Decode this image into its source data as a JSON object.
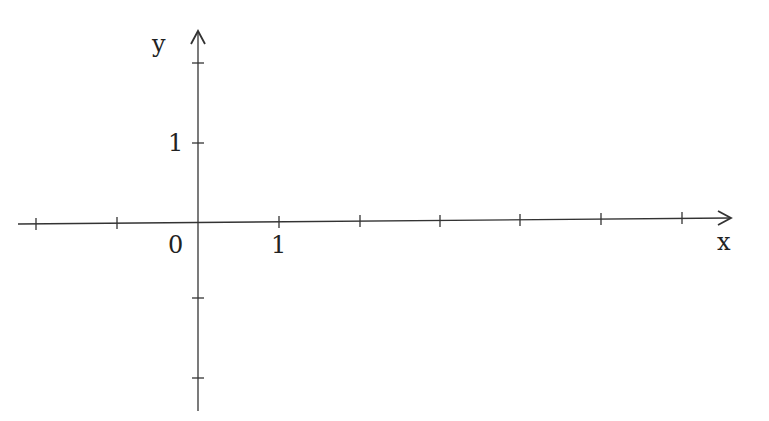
{
  "diagram": {
    "type": "coordinate-axes",
    "x_axis": {
      "label": "x",
      "ticks_px": [
        36,
        117,
        279,
        360,
        440,
        520,
        601,
        682
      ],
      "tick_labels": [
        {
          "text": "0",
          "x": 176,
          "y": 255
        },
        {
          "text": "1",
          "x": 279,
          "y": 255
        }
      ]
    },
    "y_axis": {
      "label": "y",
      "ticks_px": [
        63,
        143,
        298,
        378
      ],
      "tick_labels": [
        {
          "text": "1",
          "x": 176,
          "y": 151
        }
      ]
    },
    "origin_label": "0",
    "x_unit_label": "1",
    "y_unit_label": "1",
    "stroke_color": "#333333"
  }
}
